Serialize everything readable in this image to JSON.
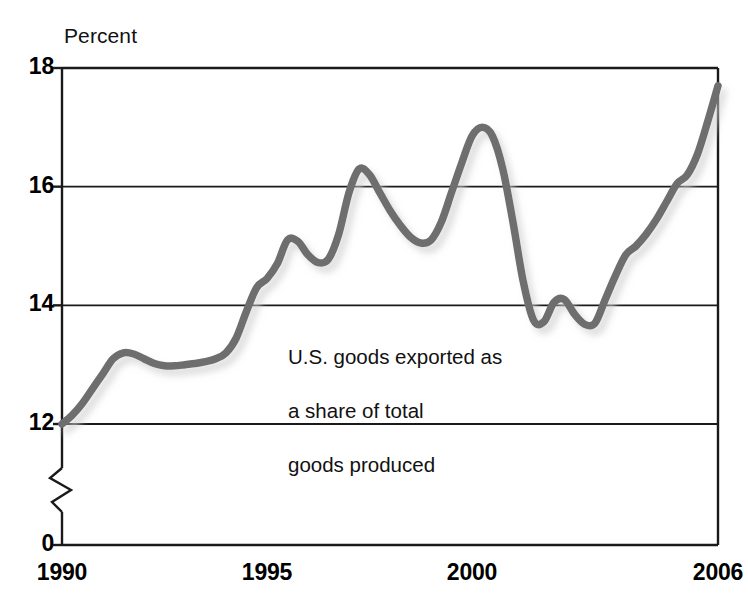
{
  "chart_data": {
    "type": "line",
    "title": "",
    "subtitle": "",
    "ylabel": "Percent",
    "xlabel": "",
    "grid": true,
    "legend": "none",
    "annotations": [
      {
        "text": "U.S. goods exported as\na share of total\ngoods produced",
        "x": 1995.2,
        "y": 13.6
      }
    ],
    "y_axis": {
      "tick_labels": [
        "18",
        "16",
        "14",
        "12",
        "0"
      ],
      "tick_values": [
        18,
        16,
        14,
        12,
        0
      ],
      "ylim": [
        12,
        18
      ],
      "axis_break": true,
      "break_note": "zigzag break between 12 and 0"
    },
    "x_axis": {
      "tick_labels": [
        "1990",
        "1995",
        "2000",
        "2006"
      ],
      "tick_values": [
        1990,
        1995,
        2000,
        2006
      ],
      "xlim": [
        1990,
        2006
      ]
    },
    "series": [
      {
        "name": "U.S. goods exported as a share of total goods produced",
        "color": "#6e6e6e",
        "x": [
          1990.0,
          1990.25,
          1990.5,
          1990.75,
          1991.0,
          1991.25,
          1991.5,
          1991.75,
          1992.0,
          1992.25,
          1992.5,
          1992.75,
          1993.0,
          1993.25,
          1993.5,
          1993.75,
          1994.0,
          1994.25,
          1994.5,
          1994.75,
          1995.0,
          1995.25,
          1995.5,
          1995.75,
          1996.0,
          1996.25,
          1996.5,
          1996.75,
          1997.0,
          1997.25,
          1997.5,
          1997.75,
          1998.0,
          1998.25,
          1998.5,
          1998.75,
          1999.0,
          1999.25,
          1999.5,
          1999.75,
          2000.0,
          2000.25,
          2000.5,
          2000.75,
          2001.0,
          2001.25,
          2001.5,
          2001.75,
          2002.0,
          2002.25,
          2002.5,
          2002.75,
          2003.0,
          2003.25,
          2003.5,
          2003.75,
          2004.0,
          2004.25,
          2004.5,
          2004.75,
          2005.0,
          2005.25,
          2005.5,
          2005.75,
          2006.0
        ],
        "y": [
          12.0,
          12.15,
          12.35,
          12.6,
          12.85,
          13.1,
          13.2,
          13.18,
          13.1,
          13.02,
          12.98,
          12.98,
          13.0,
          13.02,
          13.05,
          13.1,
          13.2,
          13.45,
          13.9,
          14.3,
          14.45,
          14.7,
          15.1,
          15.08,
          14.85,
          14.72,
          14.78,
          15.2,
          15.9,
          16.3,
          16.2,
          15.9,
          15.6,
          15.35,
          15.15,
          15.05,
          15.1,
          15.4,
          15.9,
          16.4,
          16.85,
          17.0,
          16.85,
          16.3,
          15.4,
          14.4,
          13.75,
          13.72,
          14.05,
          14.1,
          13.85,
          13.68,
          13.7,
          14.1,
          14.5,
          14.85,
          15.0,
          15.2,
          15.45,
          15.75,
          16.05,
          16.2,
          16.55,
          17.1,
          17.7
        ]
      }
    ]
  },
  "labels": {
    "y_title": "Percent",
    "y_ticks": [
      "18",
      "16",
      "14",
      "12",
      "0"
    ],
    "x_ticks": [
      "1990",
      "1995",
      "2000",
      "2006"
    ],
    "annotation_line1": "U.S. goods exported as",
    "annotation_line2": "a share of total",
    "annotation_line3": "goods produced"
  },
  "colors": {
    "line": "#6e6e6e",
    "axis": "#1a1a1a",
    "grid": "#1a1a1a",
    "background": "#ffffff",
    "shadow": "#c9c9c9"
  }
}
